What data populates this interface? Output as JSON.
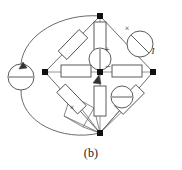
{
  "figure": {
    "caption": "(b)",
    "kind": "circuit-schematic",
    "colors": {
      "wire": "#555555",
      "component_stroke": "#4a4a4a",
      "component_fill": "#ffffff",
      "node": "#111111",
      "text": "#2a2a2a",
      "background": "#ffffff"
    }
  },
  "labels": {
    "plus": "+",
    "minus": "−",
    "current": "I",
    "cross_top_right": "×",
    "cross_bottom_left": "×"
  },
  "nodes": [
    {
      "name": "top-node",
      "x": 100,
      "y": 16
    },
    {
      "name": "left-node",
      "x": 45,
      "y": 72
    },
    {
      "name": "right-node",
      "x": 153,
      "y": 72
    },
    {
      "name": "bottom-node",
      "x": 100,
      "y": 133
    },
    {
      "name": "center-node",
      "x": 100,
      "y": 72
    }
  ],
  "components": [
    {
      "name": "resistor-top-left",
      "type": "resistor",
      "x1": 60,
      "y1": 58,
      "x2": 86,
      "y2": 31
    },
    {
      "name": "resistor-bottom-left",
      "type": "resistor",
      "x1": 59,
      "y1": 86,
      "x2": 84,
      "y2": 112
    },
    {
      "name": "resistor-bottom-right",
      "type": "resistor",
      "x1": 117,
      "y1": 112,
      "x2": 142,
      "y2": 87
    },
    {
      "name": "resistor-center-left",
      "type": "resistor",
      "x1": 60,
      "y1": 72,
      "x2": 90,
      "y2": 72
    },
    {
      "name": "resistor-center-right",
      "type": "resistor",
      "x1": 112,
      "y1": 72,
      "x2": 142,
      "y2": 72
    },
    {
      "name": "resistor-center-top",
      "type": "resistor",
      "x1": 100,
      "y1": 22,
      "x2": 100,
      "y2": 52
    },
    {
      "name": "resistor-center-bottom",
      "type": "resistor",
      "x1": 100,
      "y1": 85,
      "x2": 100,
      "y2": 116
    },
    {
      "name": "source-left-external",
      "type": "source-horizontal-bar",
      "cx": 21,
      "cy": 77,
      "r": 13
    },
    {
      "name": "source-center-vertical",
      "type": "source-vertical-line",
      "cx": 100,
      "cy": 59,
      "r": 11
    },
    {
      "name": "source-top-right",
      "type": "source-diagonal-slash",
      "cx": 140,
      "cy": 44,
      "r": 13
    },
    {
      "name": "source-bottom-right",
      "type": "source-horizontal-bar",
      "cx": 122,
      "cy": 97,
      "r": 11
    }
  ],
  "wires": [
    {
      "name": "wire-top-to-left-diagonal"
    },
    {
      "name": "wire-top-to-right-diagonal"
    },
    {
      "name": "wire-left-to-bottom-diagonal"
    },
    {
      "name": "wire-right-to-bottom-diagonal"
    },
    {
      "name": "wire-center-horizontal"
    },
    {
      "name": "wire-center-vertical"
    },
    {
      "name": "wire-outer-loop-upper"
    },
    {
      "name": "wire-outer-loop-lower"
    },
    {
      "name": "wire-bottom-quad-fan"
    }
  ]
}
